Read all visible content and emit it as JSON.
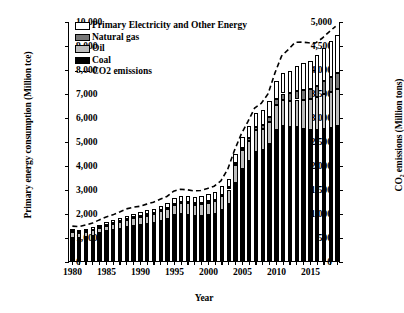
{
  "chart_data": {
    "type": "bar",
    "title": "",
    "xlabel": "Year",
    "ylabel": "Primary energy consumption (Million tce)",
    "y2label": "CO₂ emissions (Million tons)",
    "ylim": [
      0,
      5000
    ],
    "y2lim": [
      0,
      10000
    ],
    "ytick_labels": [
      "0",
      "500",
      "1,000",
      "1,500",
      "2,000",
      "2,500",
      "3,000",
      "3,500",
      "4,000",
      "4,500",
      "5,000"
    ],
    "yticks": [
      0,
      500,
      1000,
      1500,
      2000,
      2500,
      3000,
      3500,
      4000,
      4500,
      5000
    ],
    "y2tick_labels": [
      "0",
      "1,000",
      "2,000",
      "3,000",
      "4,000",
      "5,000",
      "6,000",
      "7,000",
      "8,000",
      "9,000",
      "10,000"
    ],
    "y2ticks": [
      0,
      1000,
      2000,
      3000,
      4000,
      5000,
      6000,
      7000,
      8000,
      9000,
      10000
    ],
    "xtick_labels": [
      "1980",
      "1985",
      "1990",
      "1995",
      "2000",
      "2005",
      "2010",
      "2015"
    ],
    "xticks": [
      1980,
      1985,
      1990,
      1995,
      2000,
      2005,
      2010,
      2015
    ],
    "xlim": [
      1979.5,
      2019.5
    ],
    "grid": false,
    "legend_position": "upper-left",
    "stacked": true,
    "categories": [
      1980,
      1981,
      1982,
      1983,
      1984,
      1985,
      1986,
      1987,
      1988,
      1989,
      1990,
      1991,
      1992,
      1993,
      1994,
      1995,
      1996,
      1997,
      1998,
      1999,
      2000,
      2001,
      2002,
      2003,
      2004,
      2005,
      2006,
      2007,
      2008,
      2009,
      2010,
      2011,
      2012,
      2013,
      2014,
      2015,
      2016,
      2017,
      2018,
      2019
    ],
    "series": [
      {
        "name": "Coal",
        "color": "#000000",
        "values": [
          477,
          470,
          500,
          530,
          575,
          615,
          640,
          675,
          710,
          735,
          750,
          775,
          790,
          830,
          875,
          955,
          975,
          960,
          935,
          935,
          950,
          980,
          1060,
          1180,
          1620,
          1915,
          2085,
          2280,
          2305,
          2430,
          2730,
          2810,
          2790,
          2800,
          2760,
          2730,
          2730,
          2760,
          2780,
          2810
        ]
      },
      {
        "name": "Oil",
        "color": "#bdbdbd",
        "values": [
          120,
          108,
          105,
          108,
          113,
          123,
          135,
          140,
          148,
          158,
          162,
          172,
          185,
          205,
          205,
          215,
          225,
          245,
          240,
          250,
          268,
          265,
          285,
          310,
          375,
          390,
          420,
          440,
          440,
          470,
          520,
          535,
          545,
          565,
          600,
          640,
          680,
          710,
          735,
          765
        ]
      },
      {
        "name": "Natural gas",
        "color": "#777777",
        "values": [
          18,
          17,
          17,
          18,
          18,
          19,
          20,
          21,
          22,
          23,
          24,
          25,
          25,
          26,
          26,
          27,
          28,
          29,
          29,
          31,
          33,
          35,
          38,
          42,
          50,
          58,
          68,
          82,
          95,
          105,
          125,
          145,
          165,
          185,
          200,
          215,
          235,
          280,
          320,
          350
        ]
      },
      {
        "name": "Primary Electricity and Other Energy",
        "color": "#ffffff",
        "values": [
          38,
          40,
          44,
          48,
          50,
          55,
          58,
          62,
          66,
          70,
          78,
          82,
          88,
          94,
          100,
          110,
          118,
          122,
          130,
          138,
          152,
          158,
          170,
          175,
          190,
          215,
          250,
          278,
          305,
          330,
          385,
          420,
          460,
          505,
          560,
          590,
          640,
          695,
          740,
          790
        ]
      }
    ],
    "line_series": {
      "name": "CO2 emissions",
      "style": "dashed",
      "color": "#000000",
      "axis": "right",
      "values": [
        1460,
        1440,
        1510,
        1590,
        1720,
        1840,
        1930,
        2050,
        2180,
        2250,
        2290,
        2380,
        2460,
        2580,
        2700,
        2920,
        3000,
        2980,
        2930,
        2950,
        3030,
        3130,
        3350,
        3830,
        4620,
        5300,
        5830,
        6400,
        6600,
        7000,
        7860,
        8580,
        8850,
        9150,
        9160,
        9130,
        9120,
        9320,
        9580,
        9820
      ]
    },
    "legend": [
      {
        "label": "Primary Electricity and Other Energy",
        "key": "elec"
      },
      {
        "label": "Natural gas",
        "key": "gas"
      },
      {
        "label": "Oil",
        "key": "oil"
      },
      {
        "label": "Coal",
        "key": "coal"
      },
      {
        "label": "CO2 emissions",
        "key": "line"
      }
    ]
  }
}
